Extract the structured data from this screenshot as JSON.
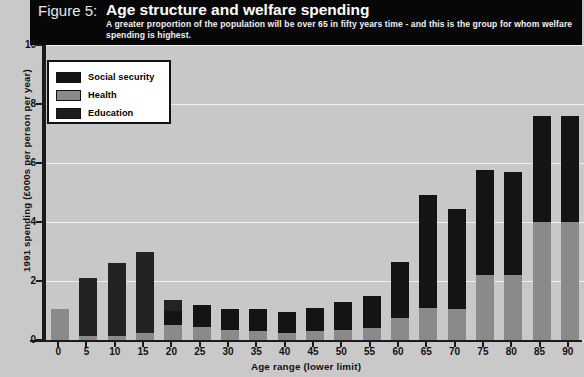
{
  "header": {
    "figure_number": "Figure 5:",
    "title": "Age structure and welfare spending",
    "subtitle": "A greater proportion of the population will be over 65 in fifty years time - and this is the group for whom welfare spending is highest."
  },
  "legend": {
    "position": "top-left",
    "items": [
      {
        "label": "Social security",
        "color": "#141414",
        "swatch_icon": "legend-swatch-icon"
      },
      {
        "label": "Health",
        "color": "#8a8a8a",
        "swatch_icon": "legend-swatch-icon"
      },
      {
        "label": "Education",
        "color": "#1c1c1c",
        "swatch_icon": "legend-swatch-icon"
      }
    ]
  },
  "chart_data": {
    "type": "bar",
    "stacked": true,
    "title": "Age structure and welfare spending",
    "subtitle": "A greater proportion of the population will be over 65 in fifty years time - and this is the group for whom welfare spending is highest.",
    "xlabel": "Age range (lower limit)",
    "ylabel": "1991 spending (£000s per person per year)",
    "ylim": [
      0,
      10
    ],
    "yticks": [
      "0",
      "2",
      "4",
      "6",
      "8",
      "10"
    ],
    "grid": true,
    "categories": [
      "0",
      "5",
      "10",
      "15",
      "20",
      "25",
      "30",
      "35",
      "40",
      "45",
      "50",
      "55",
      "60",
      "65",
      "70",
      "75",
      "80",
      "85",
      "90"
    ],
    "series": [
      {
        "name": "Health",
        "color": "#8a8a8a",
        "values": [
          1.05,
          0.15,
          0.15,
          0.25,
          0.5,
          0.45,
          0.35,
          0.3,
          0.25,
          0.3,
          0.35,
          0.4,
          0.75,
          1.1,
          1.05,
          2.2,
          2.2,
          4.0,
          4.0
        ]
      },
      {
        "name": "Social security",
        "color": "#141414",
        "values": [
          0.0,
          0.0,
          0.0,
          0.0,
          0.5,
          0.75,
          0.7,
          0.75,
          0.7,
          0.8,
          0.95,
          1.1,
          1.9,
          3.8,
          3.4,
          3.55,
          3.5,
          3.6,
          3.6
        ]
      },
      {
        "name": "Education",
        "color": "#232323",
        "values": [
          0.0,
          1.95,
          2.45,
          2.75,
          0.35,
          0.0,
          0.0,
          0.0,
          0.0,
          0.0,
          0.0,
          0.0,
          0.0,
          0.0,
          0.0,
          0.0,
          0.0,
          0.0,
          0.0
        ]
      }
    ],
    "totals": [
      1.05,
      2.1,
      2.6,
      3.0,
      1.35,
      1.2,
      1.05,
      1.05,
      0.95,
      1.1,
      1.3,
      1.5,
      2.65,
      4.9,
      4.45,
      5.75,
      5.7,
      7.6,
      7.6
    ]
  },
  "colors": {
    "background": "#c9c9c9",
    "plot_background": "#c8c8c8",
    "header_background": "#070707",
    "axis": "#1a1a1a",
    "gridline": "#f0f0f0"
  }
}
